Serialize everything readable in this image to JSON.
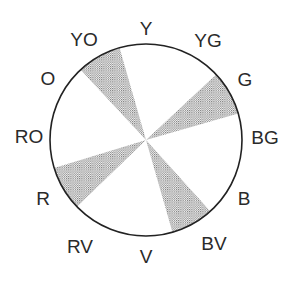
{
  "diagram": {
    "type": "color-wheel",
    "center": [
      146,
      140
    ],
    "radius": 96,
    "stroke_color": "#222222",
    "stipple_color": "#7a7a7a",
    "labels": [
      {
        "text": "Y",
        "x": 146,
        "y": 28
      },
      {
        "text": "YG",
        "x": 208,
        "y": 40
      },
      {
        "text": "G",
        "x": 245,
        "y": 79
      },
      {
        "text": "BG",
        "x": 265,
        "y": 137
      },
      {
        "text": "B",
        "x": 244,
        "y": 198
      },
      {
        "text": "BV",
        "x": 214,
        "y": 243
      },
      {
        "text": "V",
        "x": 146,
        "y": 256
      },
      {
        "text": "RV",
        "x": 80,
        "y": 246
      },
      {
        "text": "R",
        "x": 43,
        "y": 198
      },
      {
        "text": "RO",
        "x": 29,
        "y": 136
      },
      {
        "text": "O",
        "x": 48,
        "y": 78
      },
      {
        "text": "YO",
        "x": 84,
        "y": 39
      }
    ],
    "shaded_wedges": [
      {
        "name": "YO-wedge",
        "start_deg": 317,
        "end_deg": 344
      },
      {
        "name": "G-wedge",
        "start_deg": 47,
        "end_deg": 74
      },
      {
        "name": "BV-wedge",
        "start_deg": 138,
        "end_deg": 164
      },
      {
        "name": "R-wedge",
        "start_deg": 226,
        "end_deg": 253
      }
    ]
  }
}
